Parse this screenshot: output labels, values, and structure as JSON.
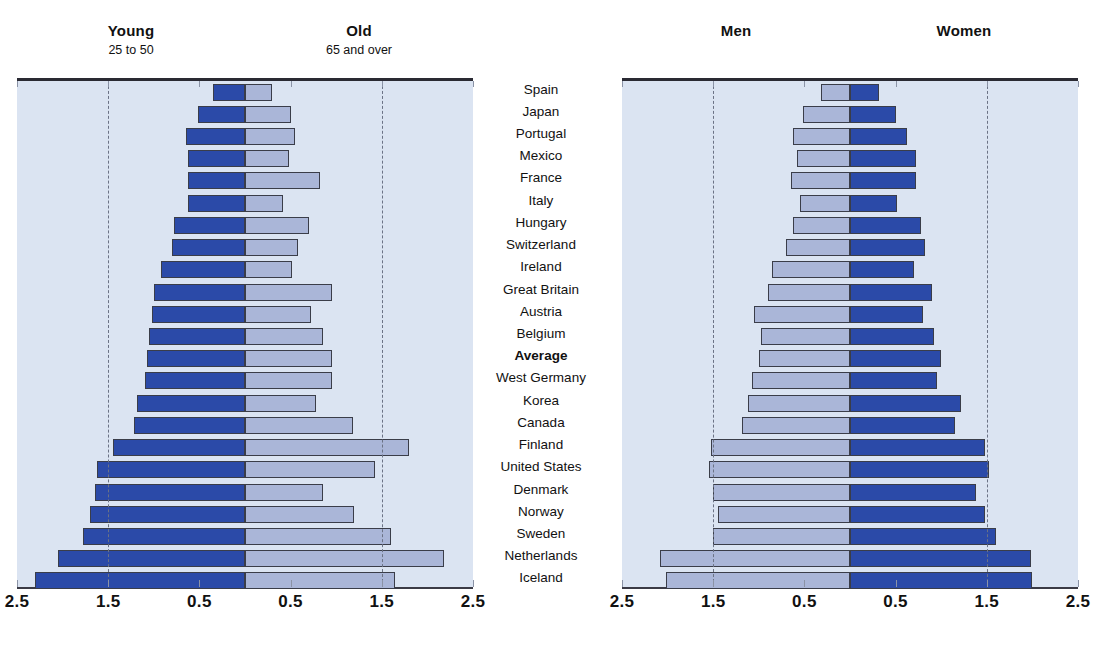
{
  "left_panel": {
    "left_title": "Young",
    "left_subtitle": "25 to 50",
    "right_title": "Old",
    "right_subtitle": "65 and over"
  },
  "right_panel": {
    "left_title": "Men",
    "left_subtitle": "",
    "right_title": "Women",
    "right_subtitle": ""
  },
  "axis_ticks": [
    "2.5",
    "1.5",
    "0.5",
    "0.5",
    "1.5",
    "2.5"
  ],
  "colors": {
    "dark_blue": "#2b4aa8",
    "light_blue": "#aab6d8",
    "plot_background": "#dbe4f2",
    "axis": "#2a2a33",
    "gridline": "#6b7285"
  },
  "categories": [
    "Spain",
    "Japan",
    "Portugal",
    "Mexico",
    "France",
    "Italy",
    "Hungary",
    "Switzerland",
    "Ireland",
    "Great Britain",
    "Austria",
    "Belgium",
    "Average",
    "West Germany",
    "Korea",
    "Canada",
    "Finland",
    "United States",
    "Denmark",
    "Norway",
    "Sweden",
    "Netherlands",
    "Iceland"
  ],
  "emphasised_category": "Average",
  "chart_data": [
    {
      "type": "bar",
      "orientation": "horizontal",
      "layout": "diverging-stacked",
      "title": "Young / Old",
      "xlabel": "",
      "ylabel": "",
      "xlim": [
        -2.5,
        2.5
      ],
      "axis_tick_values": [
        -2.5,
        -1.5,
        -0.5,
        0.5,
        1.5,
        2.5
      ],
      "axis_tick_labels": [
        "2.5",
        "1.5",
        "0.5",
        "0.5",
        "1.5",
        "2.5"
      ],
      "gridlines": [
        -1.5,
        1.5
      ],
      "grid": true,
      "legend_position": "top",
      "categories": [
        "Spain",
        "Japan",
        "Portugal",
        "Mexico",
        "France",
        "Italy",
        "Hungary",
        "Switzerland",
        "Ireland",
        "Great Britain",
        "Austria",
        "Belgium",
        "Average",
        "West Germany",
        "Korea",
        "Canada",
        "Finland",
        "United States",
        "Denmark",
        "Norway",
        "Sweden",
        "Netherlands",
        "Iceland"
      ],
      "series": [
        {
          "name": "Young",
          "subtitle": "25 to 50",
          "side": "left",
          "color": "#2b4aa8",
          "values": [
            0.35,
            0.52,
            0.65,
            0.62,
            0.62,
            0.62,
            0.78,
            0.8,
            0.92,
            1.0,
            1.02,
            1.05,
            1.08,
            1.1,
            1.18,
            1.22,
            1.45,
            1.62,
            1.65,
            1.7,
            1.78,
            2.05,
            2.3
          ]
        },
        {
          "name": "Old",
          "subtitle": "65 and over",
          "side": "right",
          "color": "#aab6d8",
          "values": [
            0.3,
            0.5,
            0.55,
            0.48,
            0.82,
            0.42,
            0.7,
            0.58,
            0.52,
            0.95,
            0.72,
            0.85,
            0.95,
            0.95,
            0.78,
            1.18,
            1.8,
            1.42,
            0.85,
            1.2,
            1.6,
            2.18,
            1.65
          ]
        }
      ]
    },
    {
      "type": "bar",
      "orientation": "horizontal",
      "layout": "diverging-stacked",
      "title": "Men / Women",
      "xlabel": "",
      "ylabel": "",
      "xlim": [
        -2.5,
        2.5
      ],
      "axis_tick_values": [
        -2.5,
        -1.5,
        -0.5,
        0.5,
        1.5,
        2.5
      ],
      "axis_tick_labels": [
        "2.5",
        "1.5",
        "0.5",
        "0.5",
        "1.5",
        "2.5"
      ],
      "gridlines": [
        -1.5,
        1.5
      ],
      "grid": true,
      "legend_position": "top",
      "categories": [
        "Spain",
        "Japan",
        "Portugal",
        "Mexico",
        "France",
        "Italy",
        "Hungary",
        "Switzerland",
        "Ireland",
        "Great Britain",
        "Austria",
        "Belgium",
        "Average",
        "West Germany",
        "Korea",
        "Canada",
        "Finland",
        "United States",
        "Denmark",
        "Norway",
        "Sweden",
        "Netherlands",
        "Iceland"
      ],
      "series": [
        {
          "name": "Men",
          "side": "left",
          "color": "#aab6d8",
          "values": [
            0.32,
            0.52,
            0.62,
            0.58,
            0.65,
            0.55,
            0.62,
            0.7,
            0.85,
            0.9,
            1.05,
            0.98,
            1.0,
            1.08,
            1.12,
            1.18,
            1.52,
            1.55,
            1.5,
            1.45,
            1.5,
            2.08,
            2.02
          ]
        },
        {
          "name": "Women",
          "side": "right",
          "color": "#2b4aa8",
          "values": [
            0.32,
            0.5,
            0.62,
            0.72,
            0.72,
            0.52,
            0.78,
            0.82,
            0.7,
            0.9,
            0.8,
            0.92,
            1.0,
            0.95,
            1.22,
            1.15,
            1.48,
            1.52,
            1.38,
            1.48,
            1.6,
            1.98,
            2.0
          ]
        }
      ]
    }
  ]
}
